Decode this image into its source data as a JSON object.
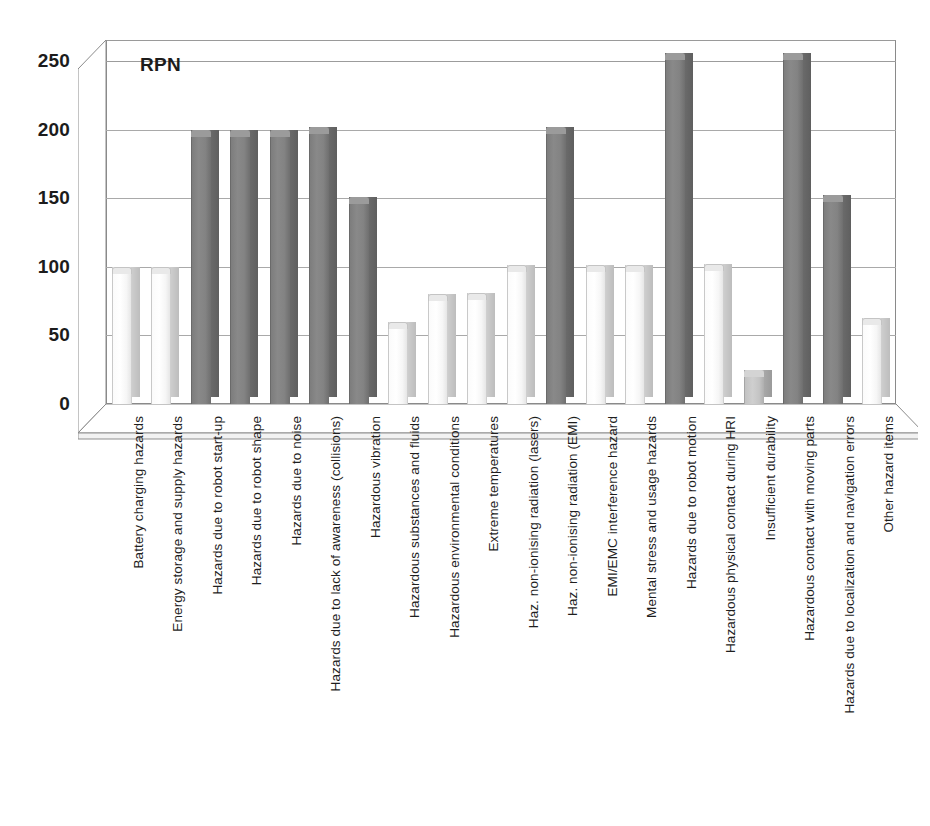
{
  "chart_data": {
    "type": "bar",
    "title": "",
    "plot_caption": "RPN",
    "xlabel": "",
    "ylabel": "RPN",
    "ylim": [
      0,
      250
    ],
    "ytick_labels": [
      "0",
      "50",
      "100",
      "150",
      "200",
      "250"
    ],
    "ytick_values": [
      0,
      50,
      100,
      150,
      200,
      250
    ],
    "grid": true,
    "legend": "none",
    "style": "3d-column",
    "categories": [
      "Battery charging hazards",
      "Energy storage and supply hazards",
      "Hazards due to robot start-up",
      "Hazards due to robot shape",
      "Hazards due to noise",
      "Hazards due to lack of awareness (collisions)",
      "Hazardous vibration",
      "Hazardous substances and fluids",
      "Hazardous environmental conditions",
      "Extreme temperatures",
      "Haz. non-ionising radiation (lasers)",
      "Haz. non-ionising radiation (EMI)",
      "EMI/EMC interference hazard",
      "Mental stress and usage hazards",
      "Hazards due to robot motion",
      "Hazardous physical contact during HRI",
      "Insufficient durability",
      "Hazardous contact with moving parts",
      "Hazards due to localization and navigation errors",
      "Other hazard items"
    ],
    "values": [
      100,
      100,
      200,
      200,
      200,
      202,
      151,
      60,
      80,
      81,
      101,
      202,
      101,
      101,
      256,
      102,
      25,
      256,
      152,
      63
    ],
    "bar_shades": [
      "light",
      "light",
      "dark",
      "dark",
      "dark",
      "dark",
      "dark",
      "light",
      "light",
      "light",
      "light",
      "dark",
      "light",
      "light",
      "dark",
      "light",
      "medium",
      "dark",
      "dark",
      "light"
    ],
    "colors": {
      "dark_bar": "#808080",
      "light_bar": "#f2f2f2",
      "medium_bar": "#c6c6c6",
      "gridline": "#a9a9a9",
      "axis_text": "#1c1c1c",
      "background": "#ffffff"
    }
  }
}
